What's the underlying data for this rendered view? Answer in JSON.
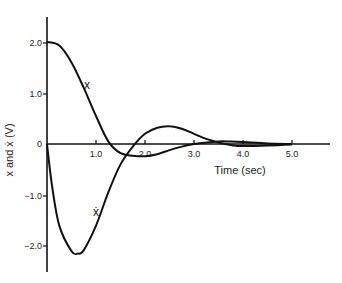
{
  "chart_data": {
    "type": "line",
    "title": "",
    "xlabel": "Time (sec)",
    "ylabel": "x and ẋ (V)",
    "xlim": [
      0,
      5.7
    ],
    "ylim": [
      -2.5,
      2.5
    ],
    "x_ticks": [
      "1.0",
      "2.0",
      "3.0",
      "4.0",
      "5.0"
    ],
    "y_ticks": [
      "2.0",
      "1.0",
      "0",
      "−1.0",
      "−2.0"
    ],
    "grid": false,
    "legend": "none (inline curve labels)",
    "series": [
      {
        "name": "x",
        "label": "x",
        "x": [
          0,
          0.25,
          0.5,
          0.75,
          1.0,
          1.25,
          1.5,
          1.75,
          2.0,
          2.25,
          2.5,
          2.75,
          3.0,
          3.25,
          3.5,
          3.75,
          4.0,
          4.5,
          5.0
        ],
        "y": [
          2.0,
          1.93,
          1.6,
          1.1,
          0.55,
          0.05,
          -0.18,
          -0.23,
          -0.24,
          -0.2,
          -0.12,
          -0.05,
          0.0,
          0.03,
          0.05,
          0.05,
          0.04,
          0.01,
          0.0
        ]
      },
      {
        "name": "x_dot",
        "label": "ẋ",
        "x": [
          0,
          0.1,
          0.25,
          0.5,
          0.63,
          0.75,
          1.0,
          1.25,
          1.5,
          1.75,
          2.0,
          2.25,
          2.5,
          2.75,
          3.0,
          3.25,
          3.5,
          3.75,
          4.0,
          4.5,
          5.0
        ],
        "y": [
          0,
          -0.8,
          -1.6,
          -2.1,
          -2.15,
          -2.08,
          -1.6,
          -0.95,
          -0.4,
          -0.05,
          0.2,
          0.32,
          0.35,
          0.3,
          0.2,
          0.1,
          0.03,
          -0.02,
          -0.04,
          -0.03,
          -0.01
        ]
      }
    ],
    "annotations": [
      {
        "text": "x",
        "at": [
          0.8,
          1.15
        ]
      },
      {
        "text": "ẋ",
        "at": [
          0.8,
          -1.5
        ]
      }
    ]
  },
  "labels": {
    "xlabel": "Time (sec)",
    "ylabel": "x and ẋ (V)",
    "x_label_curve": "x",
    "xdot_label_curve": "ẋ",
    "xt1": "1.0",
    "xt2": "2.0",
    "xt3": "3.0",
    "xt4": "4.0",
    "xt5": "5.0",
    "yt1": "2.0",
    "yt2": "1.0",
    "yt3": "0",
    "yt4": "−1.0",
    "yt5": "−2.0"
  }
}
